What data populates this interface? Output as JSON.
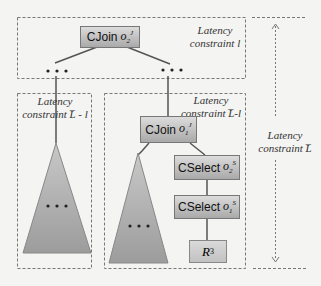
{
  "diagram": {
    "top_region": {
      "label_line1": "Latency",
      "label_line2": "constraint l"
    },
    "left_region": {
      "label_line1": "Latency",
      "label_line2": "constraint L̅ - l"
    },
    "right_region": {
      "label_line1": "Latency",
      "label_line2": "constraint L̅-l"
    },
    "total_dimension": {
      "label_line1": "Latency",
      "label_line2": "constraint L̅"
    },
    "operators": {
      "cjoin_top": {
        "name": "CJoin",
        "symbol": "o",
        "sup": "J",
        "sub": "2"
      },
      "cjoin_mid": {
        "name": "CJoin",
        "symbol": "o",
        "sup": "J",
        "sub": "1"
      },
      "cselect_2": {
        "name": "CSelect",
        "symbol": "o",
        "sup": "S",
        "sub": "2"
      },
      "cselect_1": {
        "name": "CSelect",
        "symbol": "o",
        "sup": "S",
        "sub": "1"
      }
    },
    "relation": {
      "name": "R",
      "sub": "3"
    },
    "ellipsis": "• • •",
    "colors": {
      "operator_fill": "#b8b8b8",
      "subtree_fill": "#a8a8a8",
      "edge": "#555555",
      "dashed_border": "#777777"
    }
  }
}
